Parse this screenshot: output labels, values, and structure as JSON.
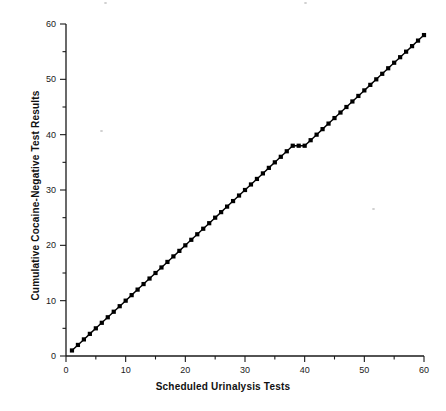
{
  "chart_data": {
    "type": "line",
    "title": "",
    "xlabel": "Scheduled Urinalysis Tests",
    "ylabel": "Cumulative Cocaine-Negative Test Results",
    "xlim": [
      0,
      60
    ],
    "ylim": [
      0,
      60
    ],
    "xticks": [
      0,
      10,
      20,
      30,
      40,
      50,
      60
    ],
    "yticks": [
      0,
      10,
      20,
      30,
      40,
      50,
      60
    ],
    "xtick_labels": [
      "0",
      "10",
      "20",
      "30",
      "40",
      "50",
      "60"
    ],
    "ytick_labels": [
      "0",
      "10",
      "20",
      "30",
      "40",
      "50",
      "60"
    ],
    "minor_tick_step": 5,
    "grid": false,
    "legend": false,
    "legend_position": "none",
    "marker": "square",
    "marker_color": "#000000",
    "line_color": "#000000",
    "series": [
      {
        "name": "Cumulative cocaine-negative test results",
        "x": [
          1,
          2,
          3,
          4,
          5,
          6,
          7,
          8,
          9,
          10,
          11,
          12,
          13,
          14,
          15,
          16,
          17,
          18,
          19,
          20,
          21,
          22,
          23,
          24,
          25,
          26,
          27,
          28,
          29,
          30,
          31,
          32,
          33,
          34,
          35,
          36,
          37,
          38,
          39,
          40,
          41,
          42,
          43,
          44,
          45,
          46,
          47,
          48,
          49,
          50,
          51,
          52,
          53,
          54,
          55,
          56,
          57,
          58,
          59,
          60
        ],
        "values": [
          1,
          2,
          3,
          4,
          5,
          6,
          7,
          8,
          9,
          10,
          11,
          12,
          13,
          14,
          15,
          16,
          17,
          18,
          19,
          20,
          21,
          22,
          23,
          24,
          25,
          26,
          27,
          28,
          29,
          30,
          31,
          32,
          33,
          34,
          35,
          36,
          37,
          38,
          38,
          38,
          39,
          40,
          41,
          42,
          43,
          44,
          45,
          46,
          47,
          48,
          49,
          50,
          51,
          52,
          53,
          54,
          55,
          56,
          57,
          58
        ]
      }
    ]
  },
  "axis": {
    "x_title": "Scheduled Urinalysis Tests",
    "y_title": "Cumulative Cocaine-Negative Test Results"
  }
}
